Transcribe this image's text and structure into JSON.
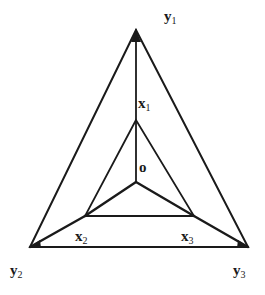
{
  "diagram": {
    "type": "nested triangles with center node",
    "stroke_color": "#1a1a1a",
    "nodes": {
      "y1": {
        "label": "y",
        "sub": "1",
        "x": 136,
        "y": 30
      },
      "y2": {
        "label": "y",
        "sub": "2",
        "x": 30,
        "y": 247
      },
      "y3": {
        "label": "y",
        "sub": "3",
        "x": 248,
        "y": 247
      },
      "x1": {
        "label": "x",
        "sub": "1",
        "x": 136,
        "y": 120
      },
      "x2": {
        "label": "x",
        "sub": "2",
        "x": 85,
        "y": 216
      },
      "x3": {
        "label": "x",
        "sub": "3",
        "x": 194,
        "y": 216
      },
      "o": {
        "label": "o",
        "x": 136,
        "y": 182
      }
    },
    "edges": [
      [
        "y1",
        "y2"
      ],
      [
        "y2",
        "y3"
      ],
      [
        "y3",
        "y1"
      ],
      [
        "x1",
        "x2"
      ],
      [
        "x2",
        "x3"
      ],
      [
        "x3",
        "x1"
      ],
      [
        "y1",
        "x1"
      ],
      [
        "x1",
        "o"
      ],
      [
        "o",
        "x2"
      ],
      [
        "o",
        "x3"
      ],
      [
        "y2",
        "x2"
      ],
      [
        "x2",
        "x3"
      ],
      [
        "x3",
        "y3"
      ]
    ]
  }
}
